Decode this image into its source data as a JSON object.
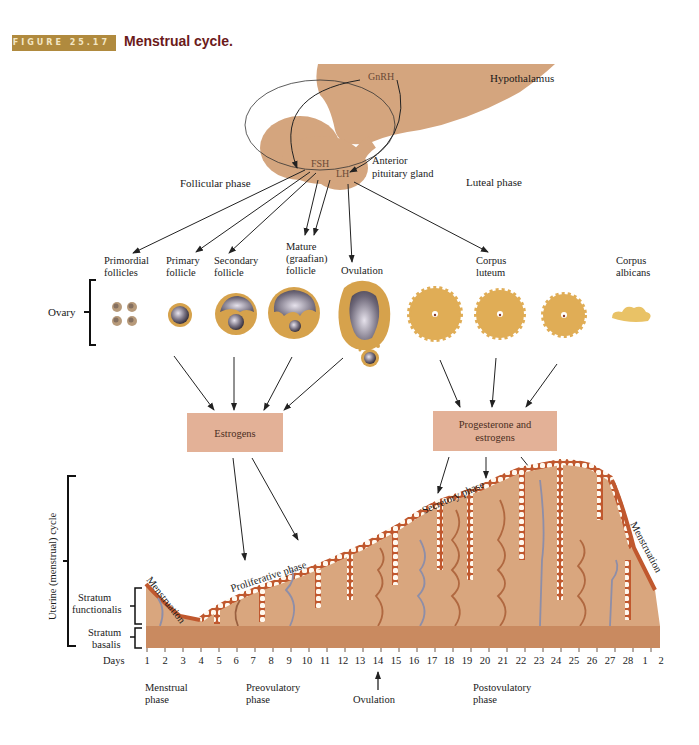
{
  "figure": {
    "number_label": "FIGURE 25.17",
    "title": "Menstrual cycle.",
    "accent_color": "#b08a3e",
    "title_color": "#6b1a1a"
  },
  "brain": {
    "hypothalamus_label": "Hypothalamus",
    "anterior_pituitary_label_line1": "Anterior",
    "anterior_pituitary_label_line2": "pituitary gland",
    "hormones": {
      "gnrh": "GnRH",
      "fsh": "FSH",
      "lh": "LH"
    },
    "tissue_color": "#d4a57e"
  },
  "phases_top": {
    "follicular": "Follicular phase",
    "luteal": "Luteal phase"
  },
  "ovary": {
    "label": "Ovary",
    "stages": [
      {
        "line1": "Primordial",
        "line2": "follicles"
      },
      {
        "line1": "Primary",
        "line2": "follicle"
      },
      {
        "line1": "Secondary",
        "line2": "follicle"
      },
      {
        "line1": "Mature",
        "line2": "(graafian)",
        "line3": "follicle"
      },
      {
        "line1": "Ovulation"
      },
      {
        "line1": "Corpus",
        "line2": "luteum"
      },
      {
        "line1": "Corpus",
        "line2": "albicans"
      }
    ],
    "follicle_color": "#d6a24c",
    "corpus_color": "#e0ad56"
  },
  "hormone_boxes": {
    "estrogens": "Estrogens",
    "progesterone_line1": "Progesterone and",
    "progesterone_line2": "estrogens",
    "box_color": "#e3b197"
  },
  "uterus": {
    "cycle_label": "Uterine (menstrual) cycle",
    "stratum_functionalis_line1": "Stratum",
    "stratum_functionalis_line2": "functionalis",
    "stratum_basalis_line1": "Stratum",
    "stratum_basalis_line2": "basalis",
    "menstruation_label": "Menstruation",
    "proliferative_label": "Proliferative phase",
    "secretory_label": "Secretory phase",
    "functionalis_color": "#d9a67e",
    "basalis_color": "#c98a60",
    "epithelium_color": "#c0582e"
  },
  "days": {
    "label": "Days",
    "values": [
      "1",
      "2",
      "3",
      "4",
      "5",
      "6",
      "7",
      "8",
      "9",
      "10",
      "11",
      "12",
      "13",
      "14",
      "15",
      "16",
      "17",
      "18",
      "19",
      "20",
      "21",
      "22",
      "23",
      "24",
      "25",
      "26",
      "27",
      "28",
      "1",
      "2"
    ]
  },
  "phases_bottom": {
    "menstrual_line1": "Menstrual",
    "menstrual_line2": "phase",
    "preovulatory_line1": "Preovulatory",
    "preovulatory_line2": "phase",
    "ovulation": "Ovulation",
    "postovulatory_line1": "Postovulatory",
    "postovulatory_line2": "phase"
  }
}
